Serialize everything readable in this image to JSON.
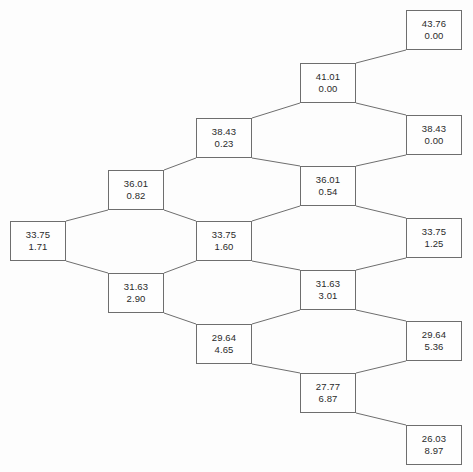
{
  "diagram": {
    "type": "binomial-option-pricing-tree",
    "steps": 4,
    "background_color": "#fdfdfd",
    "box_border_color": "#6e6e6e",
    "edge_color": "#6e6e6e",
    "text_color": "#2a2a2a",
    "box_width": 56,
    "box_height": 40,
    "node_line_labels": [
      "asset_price",
      "option_value"
    ]
  },
  "nodes": [
    {
      "id": "n0",
      "level": 0,
      "index": 0,
      "x": 10,
      "y": 221,
      "asset_price": "33.75",
      "option_value": "1.71"
    },
    {
      "id": "n1u",
      "level": 1,
      "index": 0,
      "x": 108,
      "y": 170,
      "asset_price": "36.01",
      "option_value": "0.82"
    },
    {
      "id": "n1d",
      "level": 1,
      "index": 1,
      "x": 108,
      "y": 273,
      "asset_price": "31.63",
      "option_value": "2.90"
    },
    {
      "id": "n2uu",
      "level": 2,
      "index": 0,
      "x": 196,
      "y": 118,
      "asset_price": "38.43",
      "option_value": "0.23"
    },
    {
      "id": "n2ud",
      "level": 2,
      "index": 1,
      "x": 196,
      "y": 221,
      "asset_price": "33.75",
      "option_value": "1.60"
    },
    {
      "id": "n2dd",
      "level": 2,
      "index": 2,
      "x": 196,
      "y": 324,
      "asset_price": "29.64",
      "option_value": "4.65"
    },
    {
      "id": "n3uuu",
      "level": 3,
      "index": 0,
      "x": 300,
      "y": 63,
      "asset_price": "41.01",
      "option_value": "0.00"
    },
    {
      "id": "n3uud",
      "level": 3,
      "index": 1,
      "x": 300,
      "y": 166,
      "asset_price": "36.01",
      "option_value": "0.54"
    },
    {
      "id": "n3udd",
      "level": 3,
      "index": 2,
      "x": 300,
      "y": 270,
      "asset_price": "31.63",
      "option_value": "3.01"
    },
    {
      "id": "n3ddd",
      "level": 3,
      "index": 3,
      "x": 300,
      "y": 373,
      "asset_price": "27.77",
      "option_value": "6.87"
    },
    {
      "id": "n4a",
      "level": 4,
      "index": 0,
      "x": 406,
      "y": 10,
      "asset_price": "43.76",
      "option_value": "0.00"
    },
    {
      "id": "n4b",
      "level": 4,
      "index": 1,
      "x": 406,
      "y": 115,
      "asset_price": "38.43",
      "option_value": "0.00"
    },
    {
      "id": "n4c",
      "level": 4,
      "index": 2,
      "x": 406,
      "y": 218,
      "asset_price": "33.75",
      "option_value": "1.25"
    },
    {
      "id": "n4d",
      "level": 4,
      "index": 3,
      "x": 406,
      "y": 321,
      "asset_price": "29.64",
      "option_value": "5.36"
    },
    {
      "id": "n4e",
      "level": 4,
      "index": 4,
      "x": 406,
      "y": 425,
      "asset_price": "26.03",
      "option_value": "8.97"
    }
  ],
  "edges": [
    {
      "from": "n0",
      "to": "n1u",
      "direction": "up"
    },
    {
      "from": "n0",
      "to": "n1d",
      "direction": "down"
    },
    {
      "from": "n1u",
      "to": "n2uu",
      "direction": "up"
    },
    {
      "from": "n1u",
      "to": "n2ud",
      "direction": "down"
    },
    {
      "from": "n1d",
      "to": "n2ud",
      "direction": "up"
    },
    {
      "from": "n1d",
      "to": "n2dd",
      "direction": "down"
    },
    {
      "from": "n2uu",
      "to": "n3uuu",
      "direction": "up"
    },
    {
      "from": "n2uu",
      "to": "n3uud",
      "direction": "down"
    },
    {
      "from": "n2ud",
      "to": "n3uud",
      "direction": "up"
    },
    {
      "from": "n2ud",
      "to": "n3udd",
      "direction": "down"
    },
    {
      "from": "n2dd",
      "to": "n3udd",
      "direction": "up"
    },
    {
      "from": "n2dd",
      "to": "n3ddd",
      "direction": "down"
    },
    {
      "from": "n3uuu",
      "to": "n4a",
      "direction": "up"
    },
    {
      "from": "n3uuu",
      "to": "n4b",
      "direction": "down"
    },
    {
      "from": "n3uud",
      "to": "n4b",
      "direction": "up"
    },
    {
      "from": "n3uud",
      "to": "n4c",
      "direction": "down"
    },
    {
      "from": "n3udd",
      "to": "n4c",
      "direction": "up"
    },
    {
      "from": "n3udd",
      "to": "n4d",
      "direction": "down"
    },
    {
      "from": "n3ddd",
      "to": "n4d",
      "direction": "up"
    },
    {
      "from": "n3ddd",
      "to": "n4e",
      "direction": "down"
    }
  ]
}
